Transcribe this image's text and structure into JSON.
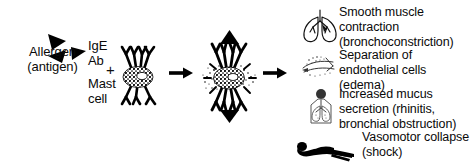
{
  "diagram": {
    "width": 471,
    "height": 166,
    "background_color": "#ffffff",
    "ink_color": "#000000"
  },
  "left": {
    "allergen_label": "Allergen\n(antigen)",
    "allergen_icon": "allergen-triangles-icon",
    "plus_symbol": "+",
    "ige_label": "IgE\nAb",
    "mast_cell_label": "Mast\ncell",
    "mast_cell_icon": "mast-cell-resting-icon"
  },
  "middle": {
    "arrow_1": "arrow-right-icon",
    "activated_cell_icon": "mast-cell-degranulating-icon",
    "arrow_2": "arrow-right-icon"
  },
  "effects": [
    {
      "icon": "lungs-icon",
      "text": "Smooth muscle\ncontraction\n(bronchoconstriction)"
    },
    {
      "icon": "endothelial-cells-icon",
      "text": "Separation of\nendothelial cells\n(edema)"
    },
    {
      "icon": "torso-airways-icon",
      "text": "Increased mucus\nsecretion (rhinitis,\nbronchial obstruction)"
    },
    {
      "icon": "collapsed-person-icon",
      "text": "Vasomotor collapse\n(shock)"
    }
  ]
}
